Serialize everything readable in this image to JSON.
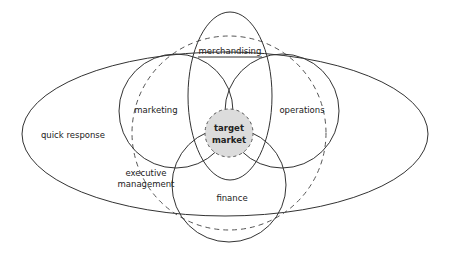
{
  "diagram": {
    "type": "venn",
    "labels": {
      "quick_response": "quick response",
      "merchandising": "merchandising",
      "marketing": "marketing",
      "operations": "operations",
      "executive_management_line1": "executive",
      "executive_management_line2": "management",
      "finance": "finance",
      "target_line1": "target",
      "target_line2": "market"
    },
    "colors": {
      "stroke": "#333333",
      "dashed_stroke": "#555555",
      "target_fill": "#dcdcdc",
      "background": "#ffffff"
    },
    "shapes": [
      {
        "name": "quick response",
        "kind": "ellipse",
        "style": "solid"
      },
      {
        "name": "merchandising",
        "kind": "ellipse",
        "style": "solid"
      },
      {
        "name": "marketing",
        "kind": "circle",
        "style": "solid"
      },
      {
        "name": "operations",
        "kind": "circle",
        "style": "solid"
      },
      {
        "name": "finance",
        "kind": "circle",
        "style": "solid"
      },
      {
        "name": "executive management",
        "kind": "circle",
        "style": "dashed"
      },
      {
        "name": "target market",
        "kind": "circle",
        "style": "dashed-filled"
      }
    ]
  }
}
